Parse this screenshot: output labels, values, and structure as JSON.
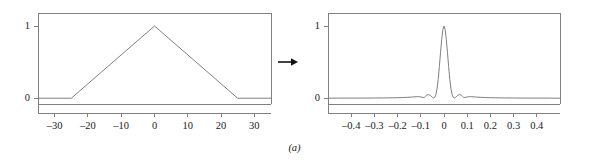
{
  "figure": {
    "caption": "(a)",
    "arrow_icon": "right-arrow-icon",
    "line_color": "#808080",
    "text_color": "#1a1a1a",
    "frame_color": "#808080",
    "background": "#ffffff"
  },
  "chart_data": [
    {
      "type": "line",
      "name": "triangle-function",
      "title": "",
      "xlabel": "",
      "ylabel": "",
      "xlim": [
        -35,
        35
      ],
      "ylim": [
        -0.08,
        1.18
      ],
      "grid": false,
      "legend": null,
      "xticks": [
        -30,
        -20,
        -10,
        0,
        10,
        20,
        30
      ],
      "xticklabels": [
        "–30",
        "–20",
        "–10",
        "0",
        "10",
        "20",
        "30"
      ],
      "yticks": [
        0,
        1
      ],
      "yticklabels": [
        "0",
        "1"
      ],
      "x": [
        -35,
        -25,
        0,
        25,
        35
      ],
      "y": [
        0,
        0,
        1,
        0,
        0
      ]
    },
    {
      "type": "line",
      "name": "sinc-squared-transform",
      "title": "",
      "xlabel": "",
      "ylabel": "",
      "xlim": [
        -0.5,
        0.5
      ],
      "ylim": [
        -0.08,
        1.18
      ],
      "grid": false,
      "legend": null,
      "xticks": [
        -0.4,
        -0.3,
        -0.2,
        -0.1,
        0,
        0.1,
        0.2,
        0.3,
        0.4
      ],
      "xticklabels": [
        "–0.4",
        "–0.3",
        "–0.2",
        "–0.1",
        "0",
        "0.1",
        "0.2",
        "0.3",
        "0.4"
      ],
      "yticks": [
        0,
        1
      ],
      "yticklabels": [
        "0",
        "1"
      ],
      "x": [
        -0.5,
        -0.46,
        -0.42,
        -0.38,
        -0.34,
        -0.3,
        -0.26,
        -0.22,
        -0.2,
        -0.18,
        -0.16,
        -0.14,
        -0.12,
        -0.11,
        -0.1,
        -0.09,
        -0.085,
        -0.08,
        -0.075,
        -0.07,
        -0.065,
        -0.06,
        -0.055,
        -0.05,
        -0.045,
        -0.04,
        -0.035,
        -0.03,
        -0.025,
        -0.02,
        -0.015,
        -0.01,
        -0.005,
        0,
        0.005,
        0.01,
        0.015,
        0.02,
        0.025,
        0.03,
        0.035,
        0.04,
        0.045,
        0.05,
        0.055,
        0.06,
        0.065,
        0.07,
        0.075,
        0.08,
        0.085,
        0.09,
        0.1,
        0.11,
        0.12,
        0.14,
        0.16,
        0.18,
        0.2,
        0.22,
        0.26,
        0.3,
        0.34,
        0.38,
        0.42,
        0.46,
        0.5
      ],
      "y": [
        0.0,
        0.001,
        0.002,
        0.001,
        0.002,
        0.003,
        0.004,
        0.006,
        0.007,
        0.009,
        0.012,
        0.016,
        0.021,
        0.022,
        0.018,
        0.01,
        0.012,
        0.026,
        0.04,
        0.049,
        0.048,
        0.04,
        0.026,
        0.012,
        0.004,
        0.012,
        0.05,
        0.13,
        0.26,
        0.44,
        0.63,
        0.81,
        0.95,
        1.0,
        0.95,
        0.81,
        0.63,
        0.44,
        0.26,
        0.13,
        0.05,
        0.012,
        0.004,
        0.012,
        0.026,
        0.04,
        0.048,
        0.049,
        0.04,
        0.026,
        0.012,
        0.01,
        0.018,
        0.022,
        0.021,
        0.016,
        0.012,
        0.009,
        0.007,
        0.006,
        0.004,
        0.003,
        0.002,
        0.001,
        0.002,
        0.001,
        0.0
      ]
    }
  ]
}
